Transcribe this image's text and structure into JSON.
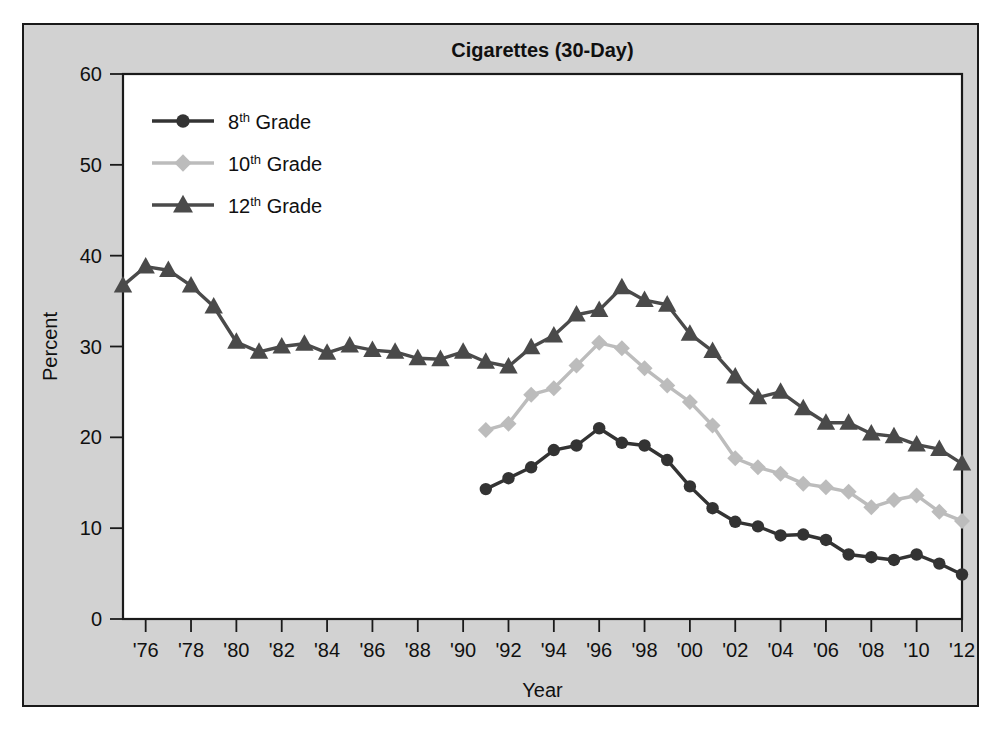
{
  "chart_data": {
    "type": "line",
    "title": "Cigarettes (30-Day)",
    "xlabel": "Year",
    "ylabel": "Percent",
    "ylim": [
      0,
      60
    ],
    "xlim": [
      1975,
      2012
    ],
    "ytick_labels": [
      "0",
      "10",
      "20",
      "30",
      "40",
      "50",
      "60"
    ],
    "ytick_values": [
      0,
      10,
      20,
      30,
      40,
      50,
      60
    ],
    "xtick_labels": [
      "'76",
      "'78",
      "'80",
      "'82",
      "'84",
      "'86",
      "'88",
      "'90",
      "'92",
      "'94",
      "'96",
      "'98",
      "'00",
      "'02",
      "'04",
      "'06",
      "'08",
      "'10",
      "'12"
    ],
    "xtick_values": [
      1976,
      1978,
      1980,
      1982,
      1984,
      1986,
      1988,
      1990,
      1992,
      1994,
      1996,
      1998,
      2000,
      2002,
      2004,
      2006,
      2008,
      2010,
      2012
    ],
    "grid": false,
    "legend_position": "top-left",
    "series": [
      {
        "name": "8th Grade",
        "label_main": "8",
        "label_sup": "th",
        "label_tail": " Grade",
        "color": "#333333",
        "marker": "circle",
        "x": [
          1991,
          1992,
          1993,
          1994,
          1995,
          1996,
          1997,
          1998,
          1999,
          2000,
          2001,
          2002,
          2003,
          2004,
          2005,
          2006,
          2007,
          2008,
          2009,
          2010,
          2011,
          2012
        ],
        "values": [
          14.3,
          15.5,
          16.7,
          18.6,
          19.1,
          21.0,
          19.4,
          19.1,
          17.5,
          14.6,
          12.2,
          10.7,
          10.2,
          9.2,
          9.3,
          8.7,
          7.1,
          6.8,
          6.5,
          7.1,
          6.1,
          4.9
        ]
      },
      {
        "name": "10th Grade",
        "label_main": "10",
        "label_sup": "th",
        "label_tail": " Grade",
        "color": "#bcbcbc",
        "marker": "diamond",
        "x": [
          1991,
          1992,
          1993,
          1994,
          1995,
          1996,
          1997,
          1998,
          1999,
          2000,
          2001,
          2002,
          2003,
          2004,
          2005,
          2006,
          2007,
          2008,
          2009,
          2010,
          2011,
          2012
        ],
        "values": [
          20.8,
          21.5,
          24.7,
          25.4,
          27.9,
          30.4,
          29.8,
          27.6,
          25.7,
          23.9,
          21.3,
          17.7,
          16.7,
          16.0,
          14.9,
          14.5,
          14.0,
          12.3,
          13.1,
          13.6,
          11.8,
          10.8
        ]
      },
      {
        "name": "12th Grade",
        "label_main": "12",
        "label_sup": "th",
        "label_tail": " Grade",
        "color": "#4a4a4a",
        "marker": "triangle",
        "x": [
          1975,
          1976,
          1977,
          1978,
          1979,
          1980,
          1981,
          1982,
          1983,
          1984,
          1985,
          1986,
          1987,
          1988,
          1989,
          1990,
          1991,
          1992,
          1993,
          1994,
          1995,
          1996,
          1997,
          1998,
          1999,
          2000,
          2001,
          2002,
          2003,
          2004,
          2005,
          2006,
          2007,
          2008,
          2009,
          2010,
          2011,
          2012
        ],
        "values": [
          36.7,
          38.8,
          38.4,
          36.7,
          34.4,
          30.5,
          29.4,
          30.0,
          30.3,
          29.3,
          30.1,
          29.6,
          29.4,
          28.7,
          28.6,
          29.4,
          28.3,
          27.8,
          29.9,
          31.2,
          33.5,
          34.0,
          36.5,
          35.1,
          34.6,
          31.4,
          29.5,
          26.7,
          24.4,
          25.0,
          23.2,
          21.6,
          21.6,
          20.4,
          20.1,
          19.2,
          18.7,
          17.1
        ]
      }
    ]
  }
}
